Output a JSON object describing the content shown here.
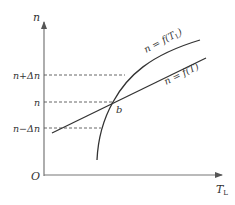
{
  "axes": {
    "y_label": "n",
    "x_label_main": "T",
    "x_label_sub": "L",
    "origin_label": "O"
  },
  "levels": [
    {
      "id": "upper",
      "label": "n+Δn",
      "y": 75
    },
    {
      "id": "mid",
      "label": "n",
      "y": 102
    },
    {
      "id": "lower",
      "label": "n−Δn",
      "y": 128
    }
  ],
  "curves": {
    "load": {
      "label_prefix": "n = f(T",
      "label_sub": "L",
      "label_suffix": ")"
    },
    "engine": {
      "label": "n = f(T)"
    }
  },
  "intersection": {
    "label": "b"
  },
  "colors": {
    "stroke": "#333333",
    "axis": "#666666",
    "dash": "#555555"
  }
}
